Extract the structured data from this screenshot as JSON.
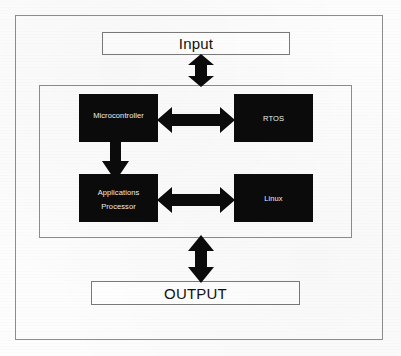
{
  "diagram": {
    "colors": {
      "frame_border": "#8d8d8d",
      "box_border": "#7a7a7a",
      "block_fill": "#0b0b0b",
      "block_text": "#f2f2f2",
      "arrow_fill": "#0b0b0b",
      "background": "#fdfdfd"
    },
    "io": {
      "input": {
        "label": "Input",
        "icon": "rectangle-outline-icon"
      },
      "output": {
        "label": "OUTPUT",
        "icon": "rectangle-outline-icon"
      }
    },
    "core": {
      "blocks": [
        {
          "id": "microcontroller",
          "lines": [
            "Microcontroller"
          ]
        },
        {
          "id": "rtos",
          "lines": [
            "RTOS"
          ]
        },
        {
          "id": "apps-processor",
          "lines": [
            "Applications",
            "Processor"
          ]
        },
        {
          "id": "linux",
          "lines": [
            "Linux"
          ]
        }
      ]
    },
    "arrows": [
      {
        "id": "input-core",
        "icon": "double-arrow-vertical-icon",
        "direction": "bidirectional",
        "orientation": "vertical",
        "from": "Input",
        "to": "Core"
      },
      {
        "id": "mcu-rtos",
        "icon": "double-arrow-horizontal-icon",
        "direction": "bidirectional",
        "orientation": "horizontal",
        "from": "Microcontroller",
        "to": "RTOS"
      },
      {
        "id": "mcu-apps",
        "icon": "arrow-down-icon",
        "direction": "downward",
        "orientation": "vertical",
        "from": "Microcontroller",
        "to": "Applications Processor"
      },
      {
        "id": "apps-linux",
        "icon": "double-arrow-horizontal-icon",
        "direction": "bidirectional",
        "orientation": "horizontal",
        "from": "Applications Processor",
        "to": "Linux"
      },
      {
        "id": "core-output",
        "icon": "double-arrow-vertical-icon",
        "direction": "bidirectional",
        "orientation": "vertical",
        "from": "Core",
        "to": "OUTPUT"
      }
    ]
  }
}
